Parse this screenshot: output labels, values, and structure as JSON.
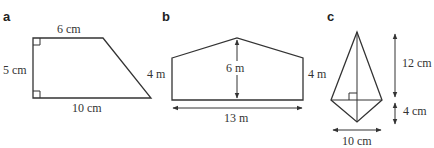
{
  "figures": [
    {
      "label": "a",
      "shape": "right trapezoid",
      "dimensions": {
        "top": "6 cm",
        "left": "5 cm",
        "bottom": "10 cm"
      },
      "right_angles": 2
    },
    {
      "label": "b",
      "shape": "pentagon (house shape)",
      "dimensions": {
        "height_peak": "6 m",
        "left_side": "4 m",
        "right_side": "4 m",
        "base": "13 m"
      }
    },
    {
      "label": "c",
      "shape": "kite",
      "dimensions": {
        "upper_height": "12 cm",
        "lower_height": "4 cm",
        "width": "10 cm"
      },
      "right_angles": 1
    }
  ],
  "labels": {
    "a": {
      "panel": "a",
      "top": "6 cm",
      "left": "5 cm",
      "bottom": "10 cm"
    },
    "b": {
      "panel": "b",
      "height": "6 m",
      "left": "4 m",
      "right": "4 m",
      "base": "13 m"
    },
    "c": {
      "panel": "c",
      "upper": "12 cm",
      "lower": "4 cm",
      "width": "10 cm"
    }
  },
  "colors": {
    "line": "#333333",
    "background": "#ffffff"
  }
}
